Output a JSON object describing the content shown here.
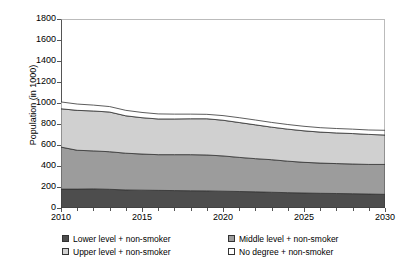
{
  "chart_data": {
    "type": "area",
    "stacked": true,
    "title": "",
    "subtitle": "",
    "xlabel": "",
    "ylabel": "Population (in 1000)",
    "x": [
      2010,
      2011,
      2012,
      2013,
      2014,
      2015,
      2016,
      2017,
      2018,
      2019,
      2020,
      2021,
      2022,
      2023,
      2024,
      2025,
      2026,
      2027,
      2028,
      2029,
      2030
    ],
    "xlim": [
      2010,
      2030
    ],
    "ylim": [
      0,
      1800
    ],
    "xticks": [
      2010,
      2015,
      2020,
      2025,
      2030
    ],
    "xtick_labels": [
      "2010",
      "2015",
      "2020",
      "2025",
      "2030"
    ],
    "xtick_minor_step": 1,
    "yticks": [
      0,
      200,
      400,
      600,
      800,
      1000,
      1200,
      1400,
      1600,
      1800
    ],
    "ytick_labels": [
      "0",
      "200",
      "400",
      "600",
      "800",
      "1000",
      "1200",
      "1400",
      "1600",
      "1800"
    ],
    "grid": false,
    "legend_position": "below",
    "series": [
      {
        "name": "Lower level + non-smoker",
        "color": "#4d4d4d",
        "values": [
          180,
          180,
          182,
          178,
          172,
          170,
          168,
          166,
          164,
          163,
          160,
          157,
          154,
          150,
          146,
          143,
          140,
          138,
          136,
          133,
          130
        ]
      },
      {
        "name": "Middle level + non-smoker",
        "color": "#9c9c9c",
        "values": [
          400,
          370,
          362,
          358,
          350,
          344,
          340,
          342,
          344,
          342,
          336,
          325,
          316,
          310,
          300,
          292,
          288,
          285,
          283,
          282,
          285
        ]
      },
      {
        "name": "Upper level + non-smoker",
        "color": "#d0d0d0",
        "values": [
          365,
          380,
          380,
          378,
          356,
          346,
          340,
          340,
          342,
          345,
          340,
          332,
          322,
          310,
          305,
          300,
          295,
          292,
          290,
          286,
          280
        ]
      },
      {
        "name": "No degree + non-smoker",
        "color": "#ffffff",
        "values": [
          65,
          60,
          56,
          52,
          52,
          50,
          48,
          46,
          44,
          42,
          44,
          46,
          46,
          45,
          44,
          43,
          42,
          42,
          42,
          42,
          45
        ]
      }
    ],
    "cumulative_totals": [
      1010,
      990,
      980,
      966,
      930,
      910,
      896,
      894,
      894,
      892,
      880,
      860,
      838,
      815,
      795,
      778,
      765,
      757,
      751,
      743,
      740
    ]
  },
  "legend": {
    "items": [
      {
        "label": "Lower level + non-smoker",
        "color": "#4d4d4d"
      },
      {
        "label": "Middle level + non-smoker",
        "color": "#9c9c9c"
      },
      {
        "label": "Upper level + non-smoker",
        "color": "#d0d0d0"
      },
      {
        "label": "No degree + non-smoker",
        "color": "#ffffff"
      }
    ]
  }
}
